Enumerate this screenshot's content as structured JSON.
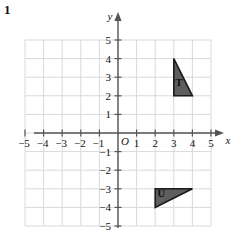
{
  "question_number": "1",
  "figure": {
    "type": "coordinate-plane",
    "origin_label": "O",
    "x_axis": {
      "label": "x",
      "min": -5,
      "max": 5,
      "ticks": [
        -5,
        -4,
        -3,
        -2,
        -1,
        1,
        2,
        3,
        4,
        5
      ],
      "tick_labels": [
        "−5",
        "−4",
        "−3",
        "−2",
        "−1",
        "1",
        "2",
        "3",
        "4",
        "5"
      ]
    },
    "y_axis": {
      "label": "y",
      "min": -5,
      "max": 5,
      "ticks": [
        5,
        4,
        3,
        2,
        1,
        -1,
        -2,
        -3,
        -4,
        -5
      ],
      "tick_labels": [
        "5",
        "4",
        "3",
        "2",
        "1",
        "−1",
        "−2",
        "−3",
        "−4",
        "−5"
      ]
    },
    "grid": {
      "visible": true,
      "color": "#d9d9d9",
      "x_range": [
        -5,
        5
      ],
      "y_range": [
        -5,
        5
      ]
    },
    "axis_color": "#555555",
    "shapes": [
      {
        "name": "T",
        "label": "T",
        "fill": "#5e5e5e",
        "stroke": "#1a1a1a",
        "label_color": "#111111",
        "vertices": [
          [
            3,
            4
          ],
          [
            3,
            2
          ],
          [
            4,
            2
          ]
        ],
        "label_position": [
          3.28,
          2.55
        ]
      },
      {
        "name": "U",
        "label": "U",
        "fill": "#5e5e5e",
        "stroke": "#1a1a1a",
        "label_color": "#111111",
        "vertices": [
          [
            2,
            -3
          ],
          [
            2,
            -4
          ],
          [
            4,
            -3
          ]
        ],
        "label_position": [
          2.32,
          -3.42
        ]
      }
    ]
  }
}
